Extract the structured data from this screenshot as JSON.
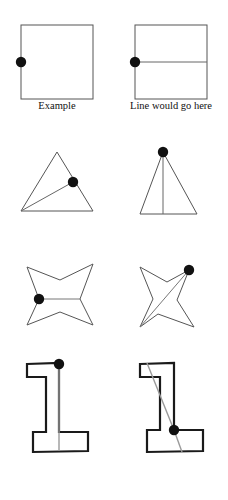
{
  "figure": {
    "width": 228,
    "height": 500,
    "background_color": "#ffffff",
    "stroke_color": "#1a1a1a",
    "thin_stroke_color": "#555555",
    "dot_color": "#000000",
    "line_color": "#8a8a8a",
    "captions": {
      "left_label": "Example",
      "right_label": "Line would go here"
    },
    "rows": [
      {
        "row_index": 1,
        "shape_name": "square",
        "left": {
          "label": "Example",
          "dot_position": "left-edge-midpoint",
          "dot_xy": [
            21,
            62
          ],
          "has_answer_line": false
        },
        "right": {
          "label": "Line would go here",
          "dot_position": "left-edge-midpoint",
          "dot_xy": [
            135,
            62
          ],
          "has_answer_line": true,
          "line_from": [
            135,
            62
          ],
          "line_to": [
            207,
            62
          ],
          "line_type": "horizontal"
        }
      },
      {
        "row_index": 2,
        "shape_name": "triangle",
        "left": {
          "dot_position": "right-edge",
          "dot_xy": [
            73,
            182
          ],
          "has_answer_line": false
        },
        "right": {
          "dot_position": "apex",
          "dot_xy": [
            163,
            152
          ],
          "has_answer_line": true,
          "line_from": [
            163,
            152
          ],
          "line_to": [
            163,
            214
          ],
          "line_type": "vertical"
        }
      },
      {
        "row_index": 3,
        "shape_name": "four-pointed-star",
        "left": {
          "dot_position": "left-inner-vertex",
          "dot_xy": [
            38,
            299
          ],
          "has_answer_line": true,
          "line_from": [
            38,
            299
          ],
          "line_to": [
            81,
            299
          ],
          "line_type": "horizontal"
        },
        "right": {
          "dot_position": "top-right-outer-point",
          "dot_xy": [
            189,
            270
          ],
          "has_answer_line": true,
          "line_from": [
            189,
            270
          ],
          "line_to": [
            140,
            327
          ],
          "line_type": "diagonal"
        }
      },
      {
        "row_index": 4,
        "shape_name": "L-block",
        "left": {
          "dot_position": "top-inner-corner",
          "dot_xy": [
            59,
            364
          ],
          "has_answer_line": true,
          "line_from": [
            59,
            364
          ],
          "line_to": [
            59,
            451
          ],
          "line_type": "vertical"
        },
        "right": {
          "dot_position": "bottom-inner-corner",
          "dot_xy": [
            174,
            430
          ],
          "has_answer_line": true,
          "line_from": [
            174,
            430
          ],
          "line_to": [
            147,
            363
          ],
          "line_type": "diagonal"
        }
      }
    ]
  }
}
